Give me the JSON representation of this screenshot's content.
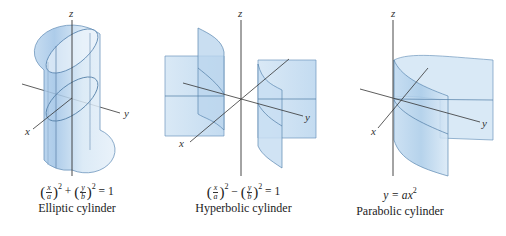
{
  "figures": [
    {
      "id": "elliptic",
      "name": "Elliptic cylinder",
      "equation": {
        "left_term": {
          "num": "x",
          "den": "a",
          "exp": "2"
        },
        "operator": "+",
        "right_term": {
          "num": "y",
          "den": "b",
          "exp": "2"
        },
        "rhs": "= 1"
      },
      "axes": {
        "x": "x",
        "y": "y",
        "z": "z"
      }
    },
    {
      "id": "hyperbolic",
      "name": "Hyperbolic cylinder",
      "equation": {
        "left_term": {
          "num": "x",
          "den": "a",
          "exp": "2"
        },
        "operator": "−",
        "right_term": {
          "num": "y",
          "den": "b",
          "exp": "2"
        },
        "rhs": "= 1"
      },
      "axes": {
        "x": "x",
        "y": "y",
        "z": "z"
      }
    },
    {
      "id": "parabolic",
      "name": "Parabolic cylinder",
      "equation": {
        "lhs": "y",
        "rhs_prefix": "= a",
        "var": "x",
        "exp": "2"
      },
      "axes": {
        "x": "x",
        "y": "y",
        "z": "z"
      }
    }
  ],
  "colors": {
    "surface_fill": "#cfe3f3",
    "surface_shade": "#a9cbe8",
    "surface_edge": "#5a86b0",
    "axis": "#333333",
    "background": "#ffffff"
  }
}
